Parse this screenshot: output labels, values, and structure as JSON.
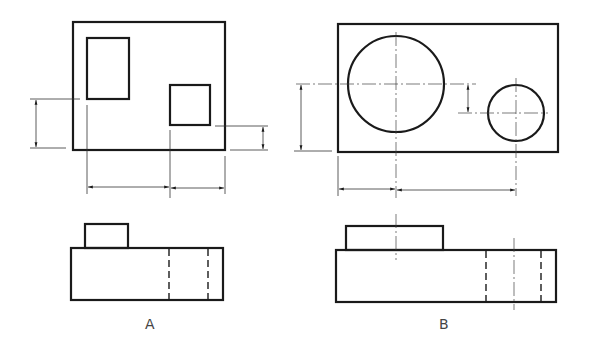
{
  "figures": [
    {
      "id": "A",
      "label": "A",
      "top_view": {
        "outline": "rectangle",
        "features": [
          "rectangular-boss (tall)",
          "rectangular-pocket (square)"
        ],
        "dimensions": [
          "vertical-left",
          "vertical-right",
          "horizontal-bottom-left",
          "horizontal-bottom-right"
        ]
      },
      "front_view": {
        "features": [
          "raised-block",
          "hidden-lines x2"
        ]
      }
    },
    {
      "id": "B",
      "label": "B",
      "top_view": {
        "outline": "rectangle",
        "features": [
          "large-circle (boss)",
          "small-circle (hole)"
        ],
        "dimensions": [
          "vertical-left",
          "vertical-middle",
          "horizontal-bottom-left",
          "horizontal-bottom-right"
        ]
      },
      "front_view": {
        "features": [
          "raised-cylinder",
          "hidden-lines x2",
          "centerlines x2"
        ]
      }
    }
  ],
  "colors": {
    "line": "#1a1a1a",
    "background": "#ffffff"
  }
}
